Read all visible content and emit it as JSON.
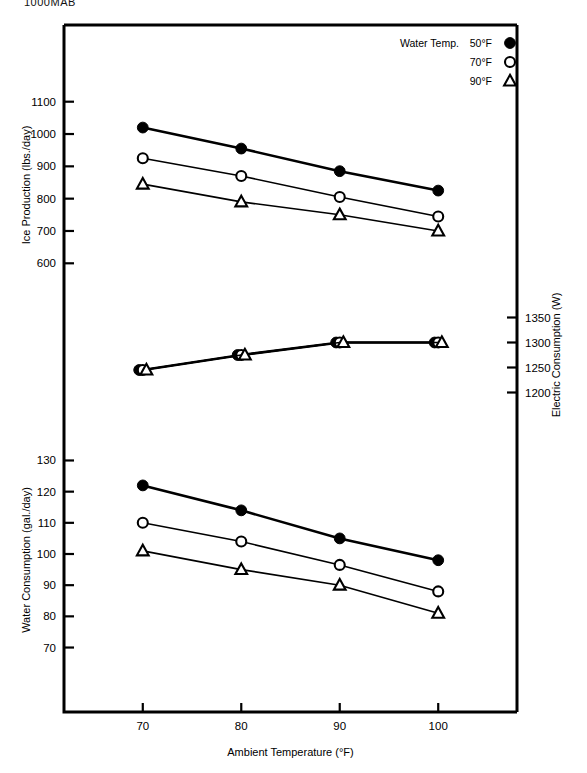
{
  "page": {
    "top_note": "1000MAB"
  },
  "chart_data": {
    "type": "line",
    "title": "",
    "xlabel": "Ambient Temperature (°F)",
    "x": [
      70,
      80,
      90,
      100
    ],
    "xlim": [
      62,
      108
    ],
    "xticks": [
      70,
      80,
      90,
      100
    ],
    "grid": false,
    "legend": {
      "position": "top-right",
      "title": "Water Temp.",
      "entries": [
        {
          "label": "50°F",
          "marker": "filled-circle"
        },
        {
          "label": "70°F",
          "marker": "open-circle"
        },
        {
          "label": "90°F",
          "marker": "open-triangle"
        }
      ]
    },
    "panels": [
      {
        "name": "ice-production",
        "ylabel": "Ice Production (lbs./day)",
        "yticks": [
          600,
          700,
          800,
          900,
          1000,
          1100
        ],
        "ylim": [
          570,
          1130
        ],
        "series": [
          {
            "name": "50°F",
            "marker": "filled-circle",
            "values": [
              1020,
              955,
              885,
              825
            ]
          },
          {
            "name": "70°F",
            "marker": "open-circle",
            "values": [
              925,
              870,
              805,
              745
            ]
          },
          {
            "name": "90°F",
            "marker": "open-triangle",
            "values": [
              845,
              790,
              750,
              700
            ]
          }
        ]
      },
      {
        "name": "electric-consumption",
        "ylabel": "Electric Consumption (W)",
        "yticks": [
          1200,
          1250,
          1300,
          1350
        ],
        "ylim": [
          1175,
          1375
        ],
        "axis_side": "right",
        "series": [
          {
            "name": "50°F",
            "marker": "filled-circle",
            "values": [
              1245,
              1275,
              1300,
              1300
            ]
          },
          {
            "name": "70°F",
            "marker": "open-circle",
            "values": [
              1245,
              1275,
              1300,
              1300
            ]
          },
          {
            "name": "90°F",
            "marker": "open-triangle",
            "values": [
              1245,
              1275,
              1300,
              1300
            ]
          }
        ]
      },
      {
        "name": "water-consumption",
        "ylabel": "Water Consumption (gal./day)",
        "yticks": [
          70,
          80,
          90,
          100,
          110,
          120,
          130
        ],
        "ylim": [
          66,
          134
        ],
        "series": [
          {
            "name": "50°F",
            "marker": "filled-circle",
            "values": [
              122,
              114,
              105,
              98
            ]
          },
          {
            "name": "70°F",
            "marker": "open-circle",
            "values": [
              110,
              104,
              96.5,
              88
            ]
          },
          {
            "name": "90°F",
            "marker": "open-triangle",
            "values": [
              101,
              95,
              90,
              81
            ]
          }
        ]
      }
    ]
  }
}
